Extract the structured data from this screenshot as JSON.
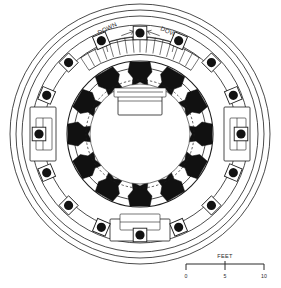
{
  "drawing": {
    "type": "architectural-floor-plan",
    "description": "Circular radial building plan",
    "center": {
      "x": 140,
      "y": 134
    },
    "background_color": "#ffffff",
    "line_color": "#1d1d1d",
    "solid_fill_color": "#111111"
  },
  "annotations": {
    "stair_left": {
      "label": "DOWN",
      "arrow": "right",
      "rotation": -28
    },
    "stair_right": {
      "label": "DOWN",
      "arrow": "left",
      "rotation": 28
    }
  },
  "scale_bar": {
    "units_label": "FEET",
    "ticks": [
      "0",
      "5",
      "10"
    ],
    "x_start": 186,
    "x_end": 264,
    "y": 268
  },
  "rings": {
    "outer_circles": [
      {
        "name": "outer-ring-1",
        "r": 130
      },
      {
        "name": "outer-ring-2",
        "r": 124
      },
      {
        "name": "outer-ring-3",
        "r": 118
      }
    ],
    "balcony_outer": {
      "name": "balcony-outer-edge",
      "r": 109
    },
    "balcony_inner": {
      "name": "balcony-inner-edge",
      "r": 97
    },
    "column_ring": {
      "name": "column-ring",
      "r": 101,
      "count": 16
    },
    "drum_outer": {
      "name": "drum-outer-wall",
      "r": 73
    },
    "drum_inner": {
      "name": "drum-inner-wall",
      "r": 66
    },
    "core_circle": {
      "name": "core-circle",
      "r": 50
    },
    "core_dashed": {
      "name": "core-dashed-circle",
      "r": 54
    }
  },
  "radial_piers": {
    "name": "radial-pier",
    "count": 12,
    "fill": "#111111"
  },
  "stairs": {
    "tread_count_left": 9,
    "tread_count_right": 9,
    "start_angle_deg": -128,
    "end_angle_deg": -52
  },
  "fixtures": {
    "top_rectangle": {
      "name": "central-top-fixture"
    },
    "bottom_vestibule": {
      "name": "entry-vestibule"
    },
    "left_alcove": {
      "name": "left-alcove"
    },
    "right_alcove": {
      "name": "right-alcove"
    }
  }
}
